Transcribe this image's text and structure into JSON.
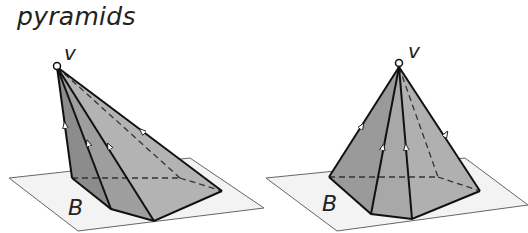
{
  "title": "pyramids",
  "figures": [
    {
      "name": "oblique-pyramid",
      "apex_label": "v",
      "base_label": "B"
    },
    {
      "name": "right-pyramid",
      "apex_label": "v",
      "base_label": "B"
    }
  ],
  "colors": {
    "plane_fill": "#f2f2f2",
    "plane_stroke": "#555555",
    "face_dark": "#8e8e8e",
    "face_mid": "#a6a6a6",
    "face_light": "#b8b8b8",
    "edge": "#111111"
  }
}
